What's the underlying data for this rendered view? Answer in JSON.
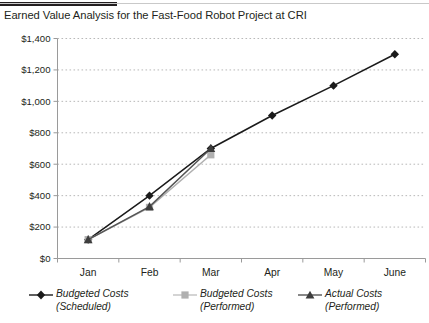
{
  "header": {
    "accent_color": "#231f20",
    "title": "Earned Value Analysis for the Fast-Food Robot Project at CRI"
  },
  "chart_data": {
    "type": "line",
    "title": "Earned Value Analysis for the Fast-Food Robot Project at CRI",
    "xlabel": "",
    "ylabel": "",
    "categories": [
      "Jan",
      "Feb",
      "Mar",
      "Apr",
      "May",
      "June"
    ],
    "ylim": [
      0,
      1400
    ],
    "ytick_values": [
      0,
      200,
      400,
      600,
      800,
      1000,
      1200,
      1400
    ],
    "ytick_labels": [
      "$0",
      "$200",
      "$400",
      "$600",
      "$800",
      "$1,000",
      "$1,200",
      "$1,400"
    ],
    "grid": true,
    "grid_style": "dotted",
    "grid_color": "#b9b9b9",
    "axis_color": "#9a9a9a",
    "legend_position": "bottom",
    "series": [
      {
        "name": "Budgeted Costs (Scheduled)",
        "legend_line1": "Budgeted Costs",
        "legend_line2": "(Scheduled)",
        "marker": "diamond",
        "color": "#1a1a1a",
        "values": [
          120,
          400,
          700,
          910,
          1100,
          1300
        ]
      },
      {
        "name": "Budgeted Costs (Performed)",
        "legend_line1": "Budgeted Costs",
        "legend_line2": "(Performed)",
        "marker": "square",
        "color": "#b0b0b0",
        "values": [
          120,
          325,
          660,
          null,
          null,
          null
        ]
      },
      {
        "name": "Actual Costs (Performed)",
        "legend_line1": "Actual Costs",
        "legend_line2": "(Performed)",
        "marker": "triangle",
        "color": "#555555",
        "values": [
          120,
          330,
          700,
          null,
          null,
          null
        ]
      }
    ]
  }
}
